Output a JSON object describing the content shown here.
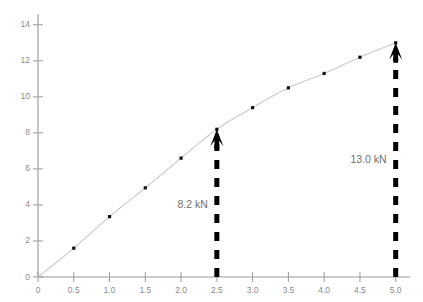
{
  "chart_data": {
    "type": "line",
    "title": "",
    "subtitle": "",
    "xlabel": "",
    "ylabel": "",
    "xlim": [
      0,
      5.2
    ],
    "ylim": [
      0,
      14.6
    ],
    "grid": false,
    "legend": "none",
    "x": [
      0,
      0.5,
      1.0,
      1.5,
      2.0,
      2.5,
      3.0,
      3.5,
      4.0,
      4.5,
      5.0
    ],
    "series": [
      {
        "name": "load-deflection-curve",
        "values": [
          0,
          1.6,
          3.35,
          4.95,
          6.6,
          8.2,
          9.4,
          10.5,
          11.3,
          12.2,
          13.0
        ],
        "line_color": "#c9c9c9",
        "marker_color": "#111111",
        "marker": "square"
      }
    ],
    "xticks": [
      0,
      0.5,
      1.0,
      1.5,
      2.0,
      2.5,
      3.0,
      3.5,
      4.0,
      4.5,
      5.0
    ],
    "xtick_labels": [
      "0",
      "0.5",
      "1.0",
      "1.5",
      "2.0",
      "2.5",
      "3.0",
      "3.5",
      "4.0",
      "4.5",
      "5.0"
    ],
    "yticks": [
      0,
      2,
      4,
      6,
      8,
      10,
      12,
      14
    ],
    "ytick_labels": [
      "0",
      "2",
      "4",
      "6",
      "8",
      "10",
      "12",
      "14"
    ],
    "annotations": [
      {
        "id": "annotation-8-2-kn",
        "label": "8.2 kN",
        "x": 2.5,
        "y_from": 0,
        "y_to": 8.2,
        "label_x": 2.5,
        "label_y": 4.0,
        "arrow_style": "dashed-up-arrow",
        "color": "#000000",
        "label_color": "#6f6f6f"
      },
      {
        "id": "annotation-13-0-kn",
        "label": "13.0 kN",
        "x": 5.0,
        "y_from": 0,
        "y_to": 13.0,
        "label_x": 5.0,
        "label_y": 6.5,
        "arrow_style": "dashed-up-arrow",
        "color": "#000000",
        "label_color": "#6f6f6f"
      }
    ],
    "axis_color": "#9a9a9a",
    "background": "#ffffff"
  }
}
